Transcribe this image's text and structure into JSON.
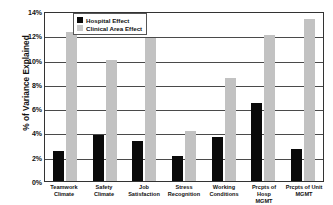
{
  "chart_data": {
    "type": "bar",
    "title": "",
    "xlabel": "",
    "ylabel": "% of Variance Explained",
    "ylim": [
      0,
      14
    ],
    "yticks": [
      "0%",
      "2%",
      "4%",
      "6%",
      "8%",
      "10%",
      "12%",
      "14%"
    ],
    "ytick_values": [
      0,
      2,
      4,
      6,
      8,
      10,
      12,
      14
    ],
    "grid": true,
    "legend_position": "top-left-inside",
    "categories": [
      "Teamwork Climate",
      "Safety Climate",
      "Job Satisfaction",
      "Stress Recognition",
      "Working Conditions",
      "Prcpts of Hosp MGMT",
      "Prcpts of Unit MGMT"
    ],
    "category_lines": [
      [
        "Teamwork",
        "Climate"
      ],
      [
        "Safety Climate",
        ""
      ],
      [
        "Job",
        "Satisfaction"
      ],
      [
        "Stress",
        "Recognition"
      ],
      [
        "Working",
        "Conditions"
      ],
      [
        "Prcpts of Hosp",
        "MGMT"
      ],
      [
        "Prcpts of Unit",
        "MGMT"
      ]
    ],
    "series": [
      {
        "name": "Hospital Effect",
        "color": "#0a0a0a",
        "values": [
          2.5,
          3.75,
          3.3,
          2.1,
          3.6,
          6.45,
          2.65
        ]
      },
      {
        "name": "Clinical Area Effect",
        "color": "#c2c2c2",
        "values": [
          12.3,
          10.0,
          11.75,
          4.1,
          8.5,
          12.0,
          13.35
        ]
      }
    ]
  },
  "legend": {
    "items": [
      {
        "label": "Hospital Effect",
        "swatch": "hospital"
      },
      {
        "label": "Clinical Area Effect",
        "swatch": "clinical"
      }
    ]
  }
}
